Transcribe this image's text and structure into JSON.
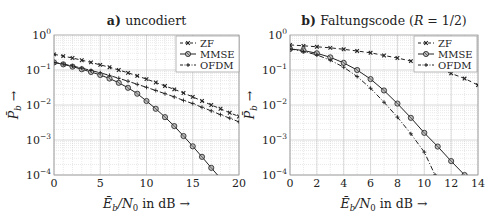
{
  "chart_data": [
    {
      "type": "line",
      "title_prefix": "a)",
      "title": "uncodiert",
      "xlabel": "Ē_b/N_0 in dB →",
      "ylabel": "P̄_b →",
      "xlim": [
        0,
        20
      ],
      "ylim": [
        0.0001,
        1
      ],
      "yscale": "log",
      "grid": true,
      "xticks": [
        0,
        5,
        10,
        15,
        20
      ],
      "yticks": [
        "10^0",
        "10^-1",
        "10^-2",
        "10^-3",
        "10^-4"
      ],
      "legend_position": "top-right",
      "series": [
        {
          "name": "ZF",
          "marker": "x",
          "dash": "4,3",
          "x": [
            0,
            1,
            2,
            3,
            4,
            5,
            6,
            7,
            8,
            9,
            10,
            11,
            12,
            13,
            14,
            15,
            16,
            17,
            18,
            19,
            20
          ],
          "y": [
            0.28,
            0.25,
            0.22,
            0.19,
            0.165,
            0.14,
            0.12,
            0.1,
            0.083,
            0.068,
            0.055,
            0.044,
            0.035,
            0.028,
            0.022,
            0.017,
            0.013,
            0.01,
            0.0078,
            0.006,
            0.0047
          ]
        },
        {
          "name": "MMSE",
          "marker": "o",
          "dash": "",
          "x": [
            0,
            1,
            2,
            3,
            4,
            5,
            6,
            7,
            8,
            9,
            10,
            11,
            12,
            13,
            14,
            15,
            16,
            17,
            18,
            19
          ],
          "y": [
            0.165,
            0.145,
            0.125,
            0.105,
            0.088,
            0.072,
            0.057,
            0.043,
            0.031,
            0.021,
            0.013,
            0.0078,
            0.0045,
            0.0025,
            0.0013,
            0.00066,
            0.00033,
            0.00016,
            8e-05,
            4e-05
          ]
        },
        {
          "name": "OFDM",
          "marker": "+",
          "dash": "5,2,1,2",
          "x": [
            0,
            1,
            2,
            3,
            4,
            5,
            6,
            7,
            8,
            9,
            10,
            11,
            12,
            13,
            14,
            15,
            16,
            17,
            18,
            19,
            20
          ],
          "y": [
            0.165,
            0.148,
            0.13,
            0.113,
            0.097,
            0.083,
            0.07,
            0.058,
            0.048,
            0.039,
            0.032,
            0.026,
            0.021,
            0.017,
            0.0135,
            0.011,
            0.0086,
            0.0068,
            0.0053,
            0.0042,
            0.0033
          ]
        }
      ]
    },
    {
      "type": "line",
      "title_prefix": "b)",
      "title": "Faltungscode (R = 1/2)",
      "xlabel": "Ē_b/N_0 in dB →",
      "ylabel": "P̄_b →",
      "xlim": [
        0,
        14
      ],
      "ylim": [
        0.0001,
        1
      ],
      "yscale": "log",
      "grid": true,
      "xticks": [
        0,
        2,
        4,
        6,
        8,
        10,
        12,
        14
      ],
      "yticks": [
        "10^0",
        "10^-1",
        "10^-2",
        "10^-3",
        "10^-4"
      ],
      "legend_position": "top-right",
      "series": [
        {
          "name": "ZF",
          "marker": "x",
          "dash": "4,3",
          "x": [
            0,
            1,
            2,
            3,
            4,
            5,
            6,
            7,
            8,
            9,
            10,
            11,
            12,
            13,
            14
          ],
          "y": [
            0.52,
            0.49,
            0.46,
            0.43,
            0.39,
            0.35,
            0.31,
            0.26,
            0.22,
            0.18,
            0.14,
            0.11,
            0.08,
            0.057,
            0.037
          ]
        },
        {
          "name": "MMSE",
          "marker": "o",
          "dash": "",
          "x": [
            0,
            1,
            2,
            3,
            4,
            5,
            6,
            7,
            8,
            9,
            10,
            11,
            12,
            13
          ],
          "y": [
            0.4,
            0.36,
            0.3,
            0.23,
            0.16,
            0.1,
            0.055,
            0.026,
            0.011,
            0.0043,
            0.0016,
            0.00065,
            0.00025,
            0.0001
          ]
        },
        {
          "name": "OFDM",
          "marker": "+",
          "dash": "5,2,1,2",
          "x": [
            0,
            1,
            2,
            3,
            4,
            5,
            6,
            7,
            8,
            9,
            10,
            10.8
          ],
          "y": [
            0.4,
            0.34,
            0.27,
            0.19,
            0.12,
            0.065,
            0.03,
            0.012,
            0.0045,
            0.0015,
            0.00045,
            0.0001
          ]
        }
      ]
    }
  ],
  "panels": [
    {
      "title_prefix": "a)",
      "title": "uncodiert"
    },
    {
      "title_prefix": "b)",
      "title": "Faltungscode (R = 1/2)"
    }
  ],
  "colors": {
    "line": "#222222",
    "grid": "#c8c8c8",
    "axis": "#999999"
  }
}
